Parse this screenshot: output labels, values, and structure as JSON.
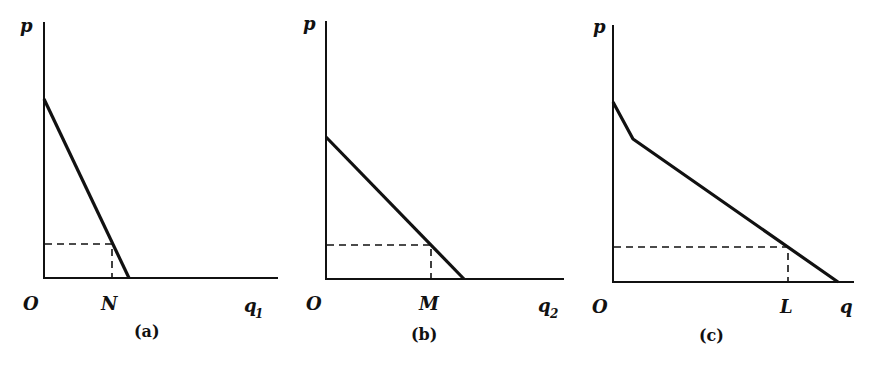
{
  "figure": {
    "panels": [
      {
        "id": "a",
        "caption": "(a)",
        "y_label": "p",
        "origin_label": "O",
        "x_label": "q",
        "x_label_sub": "1",
        "marker_label": "N",
        "axis": {
          "x0": 44,
          "y0": 278,
          "ytop": 22,
          "xend": 278
        },
        "curve": [
          [
            44,
            99
          ],
          [
            129,
            278
          ]
        ],
        "dash_point": [
          112,
          244
        ]
      },
      {
        "id": "b",
        "caption": "(b)",
        "y_label": "p",
        "origin_label": "O",
        "x_label": "q",
        "x_label_sub": "2",
        "marker_label": "M",
        "axis": {
          "x0": 326,
          "y0": 279,
          "ytop": 21,
          "xend": 564
        },
        "curve": [
          [
            326,
            137
          ],
          [
            464,
            279
          ]
        ],
        "dash_point": [
          431,
          245
        ]
      },
      {
        "id": "c",
        "caption": "(c)",
        "y_label": "p",
        "origin_label": "O",
        "x_label": "q",
        "x_label_sub": "",
        "marker_label": "L",
        "axis": {
          "x0": 613,
          "y0": 282,
          "ytop": 25,
          "xend": 854
        },
        "curve": [
          [
            613,
            102
          ],
          [
            633,
            139
          ],
          [
            838,
            282
          ]
        ],
        "dash_point": [
          788,
          247
        ]
      }
    ]
  }
}
